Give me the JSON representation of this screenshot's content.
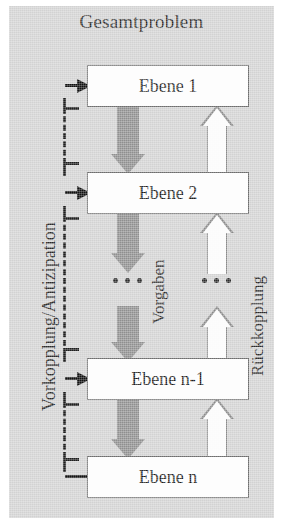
{
  "diagram": {
    "title": "Gesamtproblem",
    "levels": [
      {
        "id": "level-1",
        "label": "Ebene 1"
      },
      {
        "id": "level-2",
        "label": "Ebene 2"
      },
      {
        "id": "level-n-1",
        "label": "Ebene n-1"
      },
      {
        "id": "level-n",
        "label": "Ebene n"
      }
    ],
    "labels": {
      "left_vertical": "Vorkopplung/Antizipation",
      "center_vertical": "Vorgaben",
      "right_vertical": "Rückkopplung"
    },
    "ellipsis": {
      "left": "•••",
      "right": "•••"
    },
    "colors": {
      "canvas_background": "#d2d2d2",
      "page_background": "#ffffff",
      "box_fill": "#fdfdfd",
      "box_border": "#6d6d6d",
      "down_arrow_fill": "#8f8f8f",
      "up_arrow_fill": "#fbfbfb",
      "up_arrow_border": "#8a8a8a",
      "connector_line": "#1e1e1e",
      "text": "#1d1d1d"
    },
    "flows": {
      "downward_name": "Vorgaben",
      "upward_name": "Rückkopplung",
      "bracket_name": "Vorkopplung/Antizipation"
    }
  }
}
